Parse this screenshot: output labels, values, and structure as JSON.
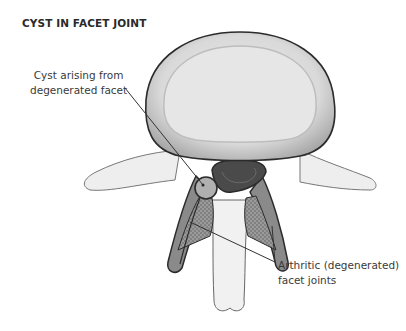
{
  "diagram": {
    "title": "CYST IN FACET JOINT",
    "labels": {
      "cyst": [
        "Cyst arising from",
        "degenerated facet"
      ],
      "facet": [
        "Arthritic (degenerated)",
        "facet joints"
      ]
    },
    "colors": {
      "outline": "#2b2b2b",
      "vertebral_body_outer": "#9a9a9a",
      "vertebral_body_inner": "#d8d8d8",
      "canal": "#4a4a4a",
      "bone_light": "#ececec",
      "facet_stipple": "#8c8c8c",
      "leader_line": "#333333"
    }
  }
}
